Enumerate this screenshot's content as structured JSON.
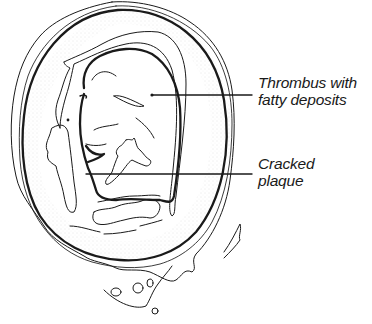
{
  "figure": {
    "colors": {
      "ink": "#1a1a1a",
      "background": "#ffffff"
    }
  },
  "labels": [
    {
      "id": "thrombus",
      "lines": [
        "Thrombus with",
        "fatty deposits"
      ]
    },
    {
      "id": "plaque",
      "lines": [
        "Cracked",
        "plaque"
      ]
    }
  ]
}
